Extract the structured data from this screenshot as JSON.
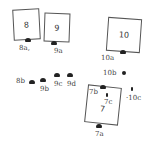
{
  "diagram": {
    "boxes": [
      {
        "id": "8",
        "label": "8"
      },
      {
        "id": "9",
        "label": "9"
      },
      {
        "id": "10",
        "label": "10"
      },
      {
        "id": "7",
        "label": "7"
      }
    ],
    "labels": {
      "8a": "8a,",
      "9a": "9a",
      "10a": "10a",
      "8b": "8b",
      "9b": "9b",
      "9c": "9c",
      "9d": "9d",
      "10b": "10b",
      "10c": "·10c",
      "7b": "7b",
      "7c": "7c",
      "7a": "7a"
    },
    "colors": {
      "line": "#555555",
      "marker": "#222222",
      "text": "#333333",
      "background": "#ffffff"
    }
  }
}
